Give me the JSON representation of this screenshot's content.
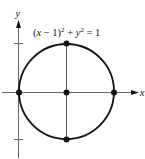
{
  "figure": {
    "equation_label": "(x − 1)² + y² = 1",
    "equation_parts": {
      "pre": "(",
      "x": "x",
      "mid": " − 1)",
      "exp1": "2",
      "plus": " + ",
      "y": "y",
      "exp2": "2",
      "eq": " = 1"
    },
    "x_axis_label": "x",
    "y_axis_label": "y",
    "circle": {
      "center": [
        1,
        0
      ],
      "radius": 1
    },
    "marked_points": [
      {
        "name": "origin",
        "coords": [
          0,
          0
        ]
      },
      {
        "name": "center",
        "coords": [
          1,
          0
        ]
      },
      {
        "name": "right",
        "coords": [
          2,
          0
        ]
      },
      {
        "name": "top",
        "coords": [
          1,
          1
        ]
      },
      {
        "name": "bottom",
        "coords": [
          1,
          -1
        ]
      }
    ],
    "y_ticks": [
      1,
      -1
    ],
    "colors": {
      "stroke": "#111111",
      "axis": "#555555"
    }
  }
}
